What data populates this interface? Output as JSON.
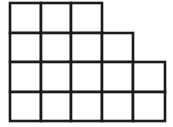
{
  "figure": {
    "description": "A step-shaped figure built from equal square cells arranged in four rows, left aligned, with the rows growing wider toward the bottom.",
    "type": "grid-staircase",
    "units": "unit squares",
    "total_squares": 17,
    "row_count": 4,
    "column_count": 5,
    "cell_size_px": 30.6,
    "origin_px": {
      "x": 10,
      "y": 3
    },
    "colors": {
      "background": "#ffffff",
      "cell_fill": "#ffffff",
      "stroke": "#1a1a1a"
    },
    "stroke_width_px": 2.6,
    "rows": [
      {
        "index": 1,
        "label": "row-1",
        "squares": 3,
        "y_top_px": 3,
        "y_bottom_px": 33
      },
      {
        "index": 2,
        "label": "row-2",
        "squares": 4,
        "y_top_px": 33,
        "y_bottom_px": 62
      },
      {
        "index": 3,
        "label": "row-3",
        "squares": 5,
        "y_top_px": 62,
        "y_bottom_px": 92
      },
      {
        "index": 4,
        "label": "row-4",
        "squares": 5,
        "y_top_px": 92,
        "y_bottom_px": 121
      }
    ],
    "column_edges_px": [
      10,
      41,
      71,
      102,
      133,
      165
    ],
    "row_edges_px": [
      3,
      33,
      62,
      92,
      121
    ],
    "cells": [
      {
        "row": 1,
        "col": 1,
        "x": 10,
        "y": 3,
        "w": 31,
        "h": 30
      },
      {
        "row": 1,
        "col": 2,
        "x": 41,
        "y": 3,
        "w": 30,
        "h": 30
      },
      {
        "row": 1,
        "col": 3,
        "x": 71,
        "y": 3,
        "w": 31,
        "h": 30
      },
      {
        "row": 2,
        "col": 1,
        "x": 10,
        "y": 33,
        "w": 31,
        "h": 29
      },
      {
        "row": 2,
        "col": 2,
        "x": 41,
        "y": 33,
        "w": 30,
        "h": 29
      },
      {
        "row": 2,
        "col": 3,
        "x": 71,
        "y": 33,
        "w": 31,
        "h": 29
      },
      {
        "row": 2,
        "col": 4,
        "x": 102,
        "y": 33,
        "w": 31,
        "h": 29
      },
      {
        "row": 3,
        "col": 1,
        "x": 10,
        "y": 62,
        "w": 31,
        "h": 30
      },
      {
        "row": 3,
        "col": 2,
        "x": 41,
        "y": 62,
        "w": 30,
        "h": 30
      },
      {
        "row": 3,
        "col": 3,
        "x": 71,
        "y": 62,
        "w": 31,
        "h": 30
      },
      {
        "row": 3,
        "col": 4,
        "x": 102,
        "y": 62,
        "w": 31,
        "h": 30
      },
      {
        "row": 3,
        "col": 5,
        "x": 133,
        "y": 62,
        "w": 32,
        "h": 30
      },
      {
        "row": 4,
        "col": 1,
        "x": 10,
        "y": 92,
        "w": 31,
        "h": 29
      },
      {
        "row": 4,
        "col": 2,
        "x": 41,
        "y": 92,
        "w": 30,
        "h": 29
      },
      {
        "row": 4,
        "col": 3,
        "x": 71,
        "y": 92,
        "w": 31,
        "h": 29
      },
      {
        "row": 4,
        "col": 4,
        "x": 102,
        "y": 92,
        "w": 31,
        "h": 29
      },
      {
        "row": 4,
        "col": 5,
        "x": 133,
        "y": 92,
        "w": 32,
        "h": 29
      }
    ]
  }
}
